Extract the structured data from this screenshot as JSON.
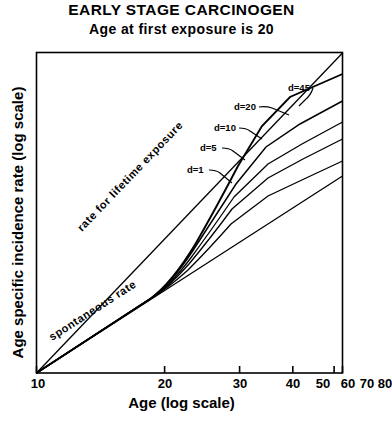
{
  "titles": {
    "main": "EARLY STAGE CARCINOGEN",
    "sub": "Age at first exposure is 20"
  },
  "chart_data": {
    "type": "line",
    "title": "EARLY STAGE CARCINOGEN",
    "subtitle": "Age at first exposure is 20",
    "xlabel": "Age (log scale)",
    "ylabel": "Age specific incidence rate (log scale)",
    "x_scale": "log",
    "y_scale": "log",
    "xlim": [
      10,
      80
    ],
    "xticks": [
      10,
      20,
      30,
      40,
      50,
      60,
      70,
      80
    ],
    "xtick_labels": [
      "10",
      "20",
      "30",
      "40",
      "50",
      "60",
      "70",
      "80"
    ],
    "yticks": [],
    "ytick_labels": [],
    "grid": false,
    "legend": "inline-annotations",
    "annotations": [
      {
        "text": "rate for lifetime exposure",
        "kind": "rotated-line-label"
      },
      {
        "text": "spontaneous rate",
        "kind": "rotated-line-label"
      }
    ],
    "series": [
      {
        "name": "rate for lifetime exposure",
        "label": "rate for lifetime exposure",
        "style": "straight-reference-line",
        "points": [
          [
            10,
            1.0
          ],
          [
            80,
            100.0
          ]
        ]
      },
      {
        "name": "spontaneous rate",
        "label": "spontaneous rate",
        "style": "straight-reference-line",
        "points": [
          [
            10,
            0.1
          ],
          [
            80,
            10.0
          ]
        ]
      },
      {
        "name": "d=45",
        "label": "d=45",
        "exposure_duration": 45,
        "points": [
          [
            10,
            0.1
          ],
          [
            20,
            0.44
          ],
          [
            25,
            0.86
          ],
          [
            30,
            1.5
          ],
          [
            40,
            3.9
          ],
          [
            50,
            8.1
          ],
          [
            60,
            14.5
          ],
          [
            70,
            23.5
          ],
          [
            80,
            35.5
          ]
        ]
      },
      {
        "name": "d=20",
        "label": "d=20",
        "exposure_duration": 20,
        "points": [
          [
            10,
            0.1
          ],
          [
            20,
            0.44
          ],
          [
            25,
            0.84
          ],
          [
            30,
            1.42
          ],
          [
            40,
            3.3
          ],
          [
            50,
            6.3
          ],
          [
            60,
            10.6
          ],
          [
            70,
            16.4
          ],
          [
            80,
            24.0
          ]
        ]
      },
      {
        "name": "d=10",
        "label": "d=10",
        "exposure_duration": 10,
        "points": [
          [
            10,
            0.1
          ],
          [
            20,
            0.44
          ],
          [
            25,
            0.8
          ],
          [
            30,
            1.3
          ],
          [
            40,
            2.8
          ],
          [
            50,
            5.1
          ],
          [
            60,
            8.3
          ],
          [
            70,
            12.6
          ],
          [
            80,
            18.0
          ]
        ]
      },
      {
        "name": "d=5",
        "label": "d=5",
        "exposure_duration": 5,
        "points": [
          [
            10,
            0.1
          ],
          [
            20,
            0.44
          ],
          [
            25,
            0.77
          ],
          [
            30,
            1.2
          ],
          [
            40,
            2.45
          ],
          [
            50,
            4.3
          ],
          [
            60,
            6.8
          ],
          [
            70,
            10.1
          ],
          [
            80,
            14.2
          ]
        ]
      },
      {
        "name": "d=1",
        "label": "d=1",
        "exposure_duration": 1,
        "points": [
          [
            10,
            0.1
          ],
          [
            20,
            0.44
          ],
          [
            25,
            0.73
          ],
          [
            30,
            1.08
          ],
          [
            40,
            2.05
          ],
          [
            50,
            3.45
          ],
          [
            60,
            5.3
          ],
          [
            70,
            7.7
          ],
          [
            80,
            10.7
          ]
        ]
      }
    ],
    "curve_labels": [
      {
        "text": "d=45"
      },
      {
        "text": "d=20"
      },
      {
        "text": "d=10"
      },
      {
        "text": "d=5"
      },
      {
        "text": "d=1"
      }
    ]
  },
  "colors": {
    "ink": "#000000",
    "background": "#ffffff"
  }
}
